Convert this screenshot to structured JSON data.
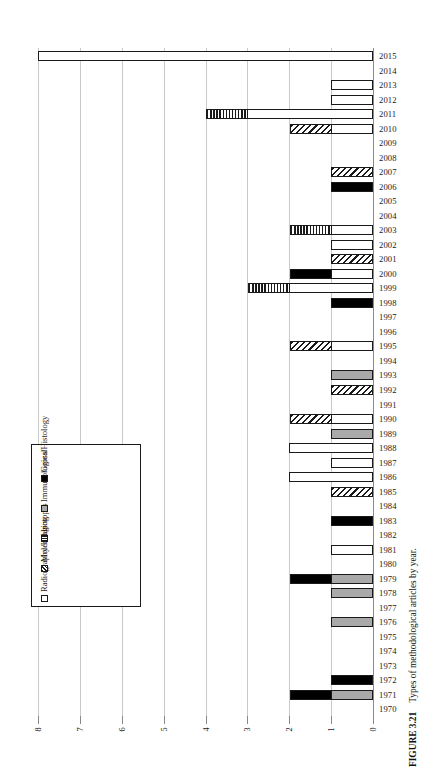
{
  "figure": {
    "caption_label": "FIGURE 3.21",
    "caption_text": "Types of methodological articles by year."
  },
  "legend": {
    "items": [
      {
        "key": "radiography",
        "label": "Radiography/Imaging",
        "color": "#ffffff",
        "pattern": "open"
      },
      {
        "key": "molecular",
        "label": "Molecular",
        "color": "#1a1a1a",
        "pattern": "diagonal-hatch"
      },
      {
        "key": "isotopes",
        "label": "Isotopes",
        "color": "#1a1a1a",
        "pattern": "vertical-hatch"
      },
      {
        "key": "immunological",
        "label": "Immunological",
        "color": "#a9a9a9",
        "pattern": "solid-gray"
      },
      {
        "key": "gross",
        "label": "Gross/Histology",
        "color": "#000000",
        "pattern": "solid-black"
      }
    ]
  },
  "chart_data": {
    "type": "bar",
    "orientation": "horizontal-stacked",
    "title": "Types of methodological articles by year.",
    "xlabel": "",
    "ylabel": "",
    "xlim": [
      0,
      8
    ],
    "x_reversed": true,
    "xticks": [
      8,
      7,
      6,
      5,
      4,
      3,
      2,
      1,
      0
    ],
    "grid": true,
    "legend_position": "inside-left",
    "categories": [
      "2015",
      "2014",
      "2013",
      "2012",
      "2011",
      "2010",
      "2009",
      "2008",
      "2007",
      "2006",
      "2005",
      "2004",
      "2003",
      "2002",
      "2001",
      "2000",
      "1999",
      "1998",
      "1997",
      "1996",
      "1995",
      "1994",
      "1993",
      "1992",
      "1991",
      "1990",
      "1989",
      "1988",
      "1987",
      "1986",
      "1985",
      "1984",
      "1983",
      "1982",
      "1981",
      "1980",
      "1979",
      "1978",
      "1977",
      "1976",
      "1975",
      "1974",
      "1973",
      "1972",
      "1971",
      "1970"
    ],
    "series": [
      {
        "name": "Radiography/Imaging",
        "key": "radiography",
        "values": [
          8,
          0,
          1,
          1,
          3,
          1,
          0,
          0,
          0,
          0,
          0,
          0,
          1,
          1,
          0,
          1,
          2,
          0,
          0,
          0,
          1,
          0,
          0,
          0,
          0,
          1,
          0,
          2,
          1,
          2,
          0,
          0,
          0,
          0,
          1,
          0,
          0,
          0,
          0,
          0,
          0,
          0,
          0,
          0,
          0,
          0
        ]
      },
      {
        "name": "Molecular",
        "key": "molecular",
        "values": [
          0,
          0,
          0,
          0,
          0,
          1,
          0,
          0,
          1,
          0,
          0,
          0,
          0,
          0,
          1,
          0,
          0,
          0,
          0,
          0,
          1,
          0,
          0,
          1,
          0,
          1,
          0,
          0,
          0,
          0,
          1,
          0,
          0,
          0,
          0,
          0,
          0,
          0,
          0,
          0,
          0,
          0,
          0,
          0,
          0,
          0
        ]
      },
      {
        "name": "Isotopes",
        "key": "isotopes",
        "values": [
          0,
          0,
          0,
          0,
          1,
          0,
          0,
          0,
          0,
          0,
          0,
          0,
          1,
          0,
          0,
          0,
          1,
          0,
          0,
          0,
          0,
          0,
          0,
          0,
          0,
          0,
          0,
          0,
          0,
          0,
          0,
          0,
          0,
          0,
          0,
          0,
          0,
          0,
          0,
          0,
          0,
          0,
          0,
          0,
          0,
          0
        ]
      },
      {
        "name": "Immunological",
        "key": "immunological",
        "values": [
          0,
          0,
          0,
          0,
          0,
          0,
          0,
          0,
          0,
          0,
          0,
          0,
          0,
          0,
          0,
          0,
          0,
          0,
          0,
          0,
          0,
          0,
          1,
          0,
          0,
          0,
          1,
          0,
          0,
          0,
          0,
          0,
          0,
          0,
          0,
          0,
          1,
          1,
          0,
          1,
          0,
          0,
          0,
          0,
          1,
          0
        ]
      },
      {
        "name": "Gross/Histology",
        "key": "gross",
        "values": [
          0,
          0,
          0,
          0,
          0,
          0,
          0,
          0,
          0,
          1,
          0,
          0,
          0,
          0,
          0,
          1,
          0,
          1,
          0,
          0,
          0,
          0,
          0,
          0,
          0,
          0,
          0,
          0,
          0,
          0,
          0,
          0,
          1,
          0,
          0,
          0,
          1,
          0,
          0,
          0,
          0,
          0,
          0,
          1,
          1,
          0
        ]
      }
    ],
    "totals": [
      8,
      0,
      1,
      1,
      4,
      2,
      0,
      0,
      1,
      1,
      0,
      0,
      2,
      1,
      1,
      2,
      3,
      1,
      0,
      0,
      2,
      0,
      1,
      1,
      0,
      2,
      1,
      2,
      1,
      2,
      1,
      0,
      1,
      0,
      1,
      0,
      2,
      1,
      0,
      1,
      0,
      0,
      0,
      1,
      2,
      0
    ]
  }
}
